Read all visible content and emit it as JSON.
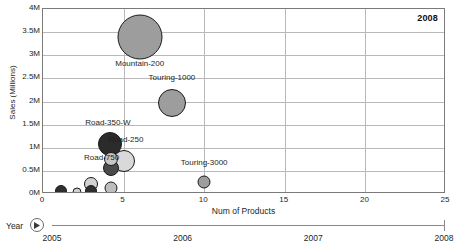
{
  "chart_data": {
    "type": "scatter",
    "title": "",
    "subtitle": "",
    "xlabel": "Num of Products",
    "ylabel": "Sales (Millions)",
    "xlim": [
      0,
      25
    ],
    "ylim": [
      0,
      4000000
    ],
    "grid": true,
    "legend_position": "none",
    "current_year": "2008",
    "xticks": [
      "0",
      "5",
      "10",
      "15",
      "20",
      "25"
    ],
    "xtick_values": [
      0,
      5,
      10,
      15,
      20,
      25
    ],
    "yticks": [
      "0M",
      "0.5M",
      "1M",
      "1.5M",
      "2M",
      "2.5M",
      "3M",
      "3.5M",
      "4M"
    ],
    "ytick_values": [
      0,
      500000,
      1000000,
      1500000,
      2000000,
      2500000,
      3000000,
      3500000,
      4000000
    ],
    "bubbles": [
      {
        "name": "Mountain-200",
        "x": 6.0,
        "y": 3400000,
        "size": 45,
        "color": "#9d9d9d",
        "label": "Mountain-200",
        "label_dx": 0,
        "label_dy": 26,
        "show_label": true
      },
      {
        "name": "Touring-1000",
        "x": 8.0,
        "y": 1960000,
        "size": 28,
        "color": "#9d9d9d",
        "label": "Touring-1000",
        "label_dx": 0,
        "label_dy": -26,
        "show_label": true
      },
      {
        "name": "Road-250",
        "x": 4.15,
        "y": 1090000,
        "size": 24,
        "color": "#2b2b2b",
        "label": "Road-250",
        "label_dx": 16,
        "label_dy": -5,
        "show_label": true
      },
      {
        "name": "Road-350-W",
        "x": 4.15,
        "y": 1090000,
        "size": 0,
        "color": "#2b2b2b",
        "label": "Road-350-W",
        "label_dx": -2,
        "label_dy": -22,
        "show_label": true
      },
      {
        "name": "Road-750",
        "x": 5.0,
        "y": 720000,
        "size": 22,
        "color": "#d9d9d9",
        "label": "Road-750",
        "label_dx": -22,
        "label_dy": -4,
        "show_label": true
      },
      {
        "name": "Touring-3000",
        "x": 10.0,
        "y": 250000,
        "size": 13,
        "color": "#9d9d9d",
        "label": "Touring-3000",
        "label_dx": 0,
        "label_dy": -20,
        "show_label": true
      },
      {
        "name": "cluster-a-dark",
        "x": 4.2,
        "y": 560000,
        "size": 16,
        "color": "#4a4a4a",
        "label": "",
        "label_dx": 0,
        "label_dy": 0,
        "show_label": false
      },
      {
        "name": "cluster-a-light",
        "x": 4.2,
        "y": 760000,
        "size": 14,
        "color": "#c6c6c6",
        "label": "",
        "label_dx": 0,
        "label_dy": 0,
        "show_label": false
      },
      {
        "name": "cluster-a-base",
        "x": 4.2,
        "y": 130000,
        "size": 13,
        "color": "#bdbdbd",
        "label": "",
        "label_dx": 0,
        "label_dy": 0,
        "show_label": false
      },
      {
        "name": "cluster-b-light",
        "x": 3.0,
        "y": 220000,
        "size": 14,
        "color": "#d2d2d2",
        "label": "",
        "label_dx": 0,
        "label_dy": 0,
        "show_label": false
      },
      {
        "name": "cluster-b-dark",
        "x": 3.0,
        "y": 60000,
        "size": 12,
        "color": "#2f2f2f",
        "label": "",
        "label_dx": 0,
        "label_dy": 0,
        "show_label": false
      },
      {
        "name": "cluster-c-light",
        "x": 2.1,
        "y": 40000,
        "size": 9,
        "color": "#cfcfcf",
        "label": "",
        "label_dx": 0,
        "label_dy": 0,
        "show_label": false
      },
      {
        "name": "cluster-d-dark",
        "x": 1.1,
        "y": 55000,
        "size": 12,
        "color": "#2f2f2f",
        "label": "",
        "label_dx": 0,
        "label_dy": 0,
        "show_label": false
      }
    ]
  },
  "timeline": {
    "label": "Year",
    "play_icon": "play-icon",
    "ticks": [
      "2005",
      "2006",
      "2007",
      "2008"
    ],
    "tick_values": [
      2005,
      2006,
      2007,
      2008
    ],
    "handle_value": 2008
  },
  "colors": {
    "axis": "#7a7a7a",
    "grid": "#b9b9b9",
    "text": "#231f20",
    "bubble_stroke": "#1a1a1a",
    "background": "#ffffff"
  }
}
